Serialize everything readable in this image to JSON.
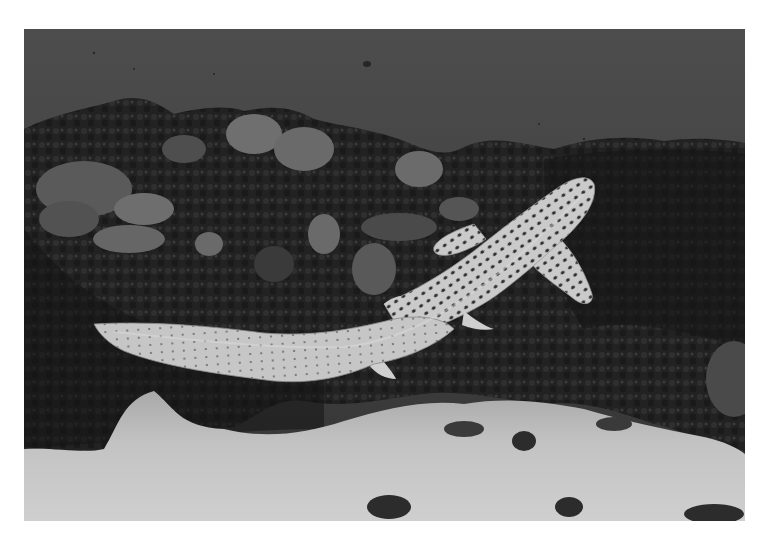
{
  "photo": {
    "subject": "spotted shark swimming over coral reef",
    "mode": "grayscale",
    "elements": [
      "open-water",
      "coral-reef",
      "shark",
      "sand-floor"
    ]
  },
  "colors": {
    "border": "#ffffff",
    "water_top": "#4a4a4a",
    "water_bottom": "#3c3c3c",
    "reef_dark": "#1c1c1c",
    "reef_mid": "#3a3a3a",
    "coral_light": "#7a7a7a",
    "shark_body": "#c8c8c8",
    "shark_spot": "#2a2a2a",
    "sand": "#c4c4c4"
  }
}
